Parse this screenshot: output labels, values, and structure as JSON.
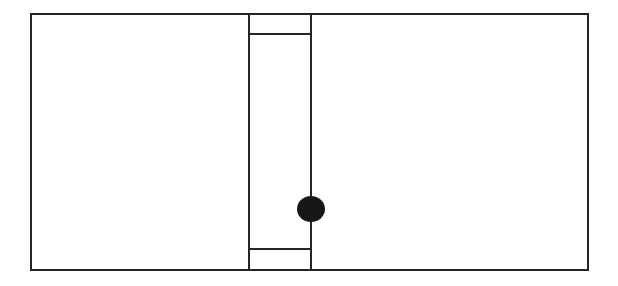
{
  "canvas": {
    "width": 618,
    "height": 286,
    "background_color": "#ffffff",
    "title": "Line Diagram"
  },
  "style": {
    "line_color": "#262626",
    "dot_color": "#171717",
    "outer_stroke_width": 2,
    "inner_stroke_width": 2,
    "crossbar_stroke_width": 2
  },
  "diagram_data": {
    "type": "line-drawing",
    "description": "Rectangular outline divided by two vertical lines forming a narrow central column, with horizontal crossbars near the top and bottom of that column and a solid black circle centered on the right vertical line at mid height.",
    "shapes": [
      {
        "id": "outer-frame",
        "name": "outer-rectangle",
        "kind": "rect",
        "x": 31,
        "y": 14,
        "width": 557,
        "height": 256,
        "fill": "none",
        "stroke": "#262626",
        "stroke_width": 2
      },
      {
        "id": "divider-left",
        "name": "left-vertical-divider",
        "kind": "line",
        "x1": 249,
        "y1": 14,
        "x2": 249,
        "y2": 270,
        "stroke": "#262626",
        "stroke_width": 2
      },
      {
        "id": "divider-right",
        "name": "right-vertical-divider",
        "kind": "line",
        "x1": 311,
        "y1": 14,
        "x2": 311,
        "y2": 270,
        "stroke": "#262626",
        "stroke_width": 2
      },
      {
        "id": "crossbar-top",
        "name": "top-crossbar",
        "kind": "line",
        "x1": 249,
        "y1": 34,
        "x2": 311,
        "y2": 34,
        "stroke": "#262626",
        "stroke_width": 2
      },
      {
        "id": "crossbar-bottom",
        "name": "bottom-crossbar",
        "kind": "line",
        "x1": 249,
        "y1": 249,
        "x2": 311,
        "y2": 249,
        "stroke": "#262626",
        "stroke_width": 2
      },
      {
        "id": "center-dot",
        "name": "center-dot",
        "kind": "ellipse",
        "cx": 311,
        "cy": 209,
        "rx": 14,
        "ry": 13,
        "fill": "#171717",
        "stroke": "none"
      }
    ],
    "regions": [
      {
        "id": "region-left",
        "name": "left-panel",
        "x": 31,
        "y": 14,
        "width": 218,
        "height": 256
      },
      {
        "id": "region-center",
        "name": "center-column",
        "x": 249,
        "y": 14,
        "width": 62,
        "height": 256
      },
      {
        "id": "region-right",
        "name": "right-panel",
        "x": 311,
        "y": 14,
        "width": 277,
        "height": 256
      }
    ]
  }
}
